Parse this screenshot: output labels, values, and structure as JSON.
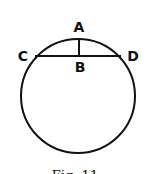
{
  "diagram": {
    "labels": {
      "A": "A",
      "B": "B",
      "C": "C",
      "D": "D"
    },
    "caption": "Fig. 11",
    "stroke_color": "#111111",
    "background": "#ffffff"
  }
}
